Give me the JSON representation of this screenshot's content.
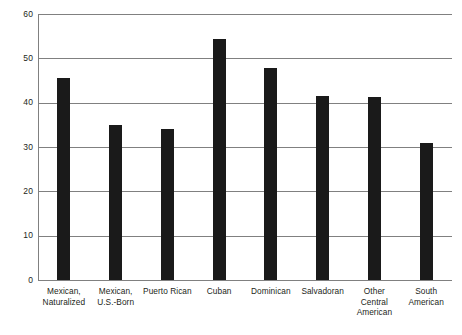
{
  "chart_data": {
    "type": "bar",
    "title": "",
    "subtitle": "",
    "xlabel": "",
    "ylabel": "",
    "ylim": [
      0,
      60
    ],
    "ytick_step": 10,
    "yticks": [
      "60",
      "50",
      "40",
      "30",
      "20",
      "10",
      "0"
    ],
    "grid": true,
    "legend": "none",
    "orientation": "vertical",
    "bar_color": "#1a1a1a",
    "grid_color": "#808080",
    "categories": [
      "Mexican,\nNaturalized",
      "Mexican,\nU.S.-Born",
      "Puerto Rican",
      "Cuban",
      "Dominican",
      "Salvadoran",
      "Other\nCentral\nAmerican",
      "South\nAmerican"
    ],
    "values": [
      45.5,
      35.0,
      34.0,
      54.4,
      47.9,
      41.6,
      41.2,
      30.8
    ]
  },
  "footer": {
    "partial_caption": ""
  }
}
